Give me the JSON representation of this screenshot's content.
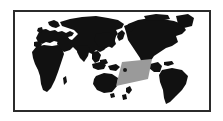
{
  "figure": {
    "kind": "world-map",
    "projection": "pacific-centered-world",
    "title": "",
    "caption": "",
    "background_color": "#ffffff"
  },
  "frame": {
    "border_color": "#2b2b2b",
    "border_width_px": 2,
    "fill_color": "#ffffff",
    "x": 13,
    "y": 10,
    "width": 198,
    "height": 102
  },
  "layers": {
    "landmass": {
      "name": "world-landmasses",
      "color": "#111111",
      "label": ""
    },
    "highlight_region": {
      "name": "pacific-highlight-region",
      "color": "#9a9a9a",
      "label": "",
      "shape": "quadrilateral",
      "vertices": [
        [
          122,
          62
        ],
        [
          152,
          59
        ],
        [
          148,
          79
        ],
        [
          116,
          86
        ]
      ]
    },
    "marker": {
      "name": "location-marker",
      "color": "#1a1a1a",
      "label": "",
      "x": 125,
      "y": 70,
      "radius": 2
    }
  },
  "chart_data": {
    "type": "map",
    "title": "",
    "xlabel": "",
    "ylabel": "",
    "legend": [],
    "annotations": [],
    "regions": [
      {
        "name": "highlight-area",
        "color": "#9a9a9a"
      },
      {
        "name": "land",
        "color": "#111111"
      },
      {
        "name": "ocean",
        "color": "#ffffff"
      }
    ],
    "points": [
      {
        "name": "marker",
        "x": 125,
        "y": 70
      }
    ]
  }
}
